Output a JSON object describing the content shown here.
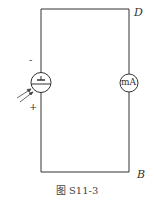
{
  "diagram": {
    "labels": {
      "top_right": "D",
      "bottom_right": "B",
      "minus": "-",
      "plus": "+",
      "meter": "mA"
    },
    "caption": "图 S11-3",
    "components": [
      {
        "type": "phototube",
        "position": "left branch"
      },
      {
        "type": "milliammeter",
        "label": "mA",
        "position": "right branch"
      },
      {
        "type": "incident-light",
        "position": "left of phototube"
      }
    ],
    "colors": {
      "line": "#333333",
      "background": "#ffffff"
    }
  }
}
